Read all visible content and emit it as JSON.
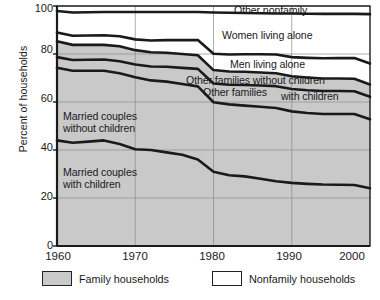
{
  "chart_data": {
    "type": "area",
    "title": "",
    "xlabel": "",
    "ylabel": "Percent of households",
    "xlim": [
      1960,
      2000
    ],
    "ylim": [
      0,
      100
    ],
    "xticks": [
      1960,
      1970,
      1980,
      1990,
      2000
    ],
    "yticks": [
      0,
      20,
      40,
      60,
      80,
      100
    ],
    "grid": true,
    "stacked": true,
    "legend_position": "bottom",
    "x": [
      1960,
      1962,
      1964,
      1966,
      1968,
      1970,
      1972,
      1974,
      1976,
      1978,
      1980,
      1982,
      1984,
      1986,
      1988,
      1990,
      1992,
      1994,
      1996,
      1998,
      2000
    ],
    "series": [
      {
        "name": "Married couples with children",
        "label": "Married couples\nwith children",
        "group": "Family households",
        "values": [
          44.0,
          43.0,
          43.5,
          44.0,
          42.5,
          40.3,
          40.0,
          39.0,
          38.0,
          36.0,
          30.9,
          29.5,
          29.0,
          28.0,
          27.0,
          26.3,
          25.9,
          25.6,
          25.5,
          25.4,
          24.1
        ],
        "cumulative": [
          44.0,
          43.0,
          43.5,
          44.0,
          42.5,
          40.3,
          40.0,
          39.0,
          38.0,
          36.0,
          30.9,
          29.5,
          29.0,
          28.0,
          27.0,
          26.3,
          25.9,
          25.6,
          25.5,
          25.4,
          24.1
        ]
      },
      {
        "name": "Married couples without children",
        "label": "Married couples\nwithout children",
        "group": "Family households",
        "values": [
          30.3,
          30.0,
          29.5,
          29.0,
          29.5,
          30.0,
          29.0,
          29.5,
          29.5,
          30.5,
          29.0,
          29.5,
          29.5,
          30.0,
          30.5,
          29.8,
          29.5,
          29.4,
          29.5,
          29.6,
          28.7
        ],
        "cumulative": [
          74.3,
          73.0,
          73.0,
          73.0,
          72.0,
          70.3,
          69.0,
          68.5,
          67.5,
          66.5,
          59.9,
          59.0,
          58.5,
          58.0,
          57.5,
          56.1,
          55.4,
          55.0,
          55.0,
          55.0,
          52.8
        ]
      },
      {
        "name": "Other families with children",
        "label": "Other families\nwith children",
        "group": "Family households",
        "values": [
          4.4,
          4.5,
          4.6,
          4.7,
          5.0,
          5.3,
          5.8,
          6.2,
          6.7,
          7.3,
          7.8,
          8.2,
          8.6,
          8.9,
          9.1,
          9.3,
          9.5,
          9.6,
          9.6,
          9.5,
          9.4
        ],
        "cumulative": [
          78.7,
          77.5,
          77.6,
          77.7,
          77.0,
          75.6,
          74.8,
          74.7,
          74.2,
          73.8,
          67.7,
          67.2,
          67.1,
          66.9,
          66.6,
          65.4,
          64.9,
          64.6,
          64.6,
          64.5,
          62.2
        ]
      },
      {
        "name": "Other families without children",
        "label": "Other families without children",
        "group": "Family households",
        "values": [
          6.6,
          6.3,
          6.2,
          6.1,
          6.2,
          6.0,
          5.9,
          5.8,
          5.8,
          5.7,
          5.6,
          5.5,
          5.5,
          5.4,
          5.4,
          5.3,
          5.3,
          5.2,
          5.2,
          5.2,
          5.1
        ],
        "cumulative": [
          85.3,
          83.8,
          83.8,
          83.8,
          83.2,
          81.6,
          80.7,
          80.5,
          80.0,
          79.5,
          73.3,
          72.7,
          72.6,
          72.3,
          72.0,
          70.7,
          70.2,
          69.8,
          69.8,
          69.7,
          67.3
        ]
      },
      {
        "name": "Men living alone",
        "label": "Men living alone",
        "group": "Nonfamily households",
        "values": [
          3.7,
          3.8,
          3.9,
          4.0,
          4.2,
          4.5,
          4.9,
          5.3,
          5.8,
          6.3,
          6.8,
          7.1,
          7.3,
          7.6,
          7.8,
          8.0,
          8.2,
          8.4,
          8.5,
          8.6,
          8.7
        ],
        "cumulative": [
          89.0,
          87.6,
          87.7,
          87.8,
          87.4,
          86.1,
          85.6,
          85.8,
          85.8,
          85.8,
          80.1,
          79.8,
          79.9,
          79.9,
          79.8,
          78.7,
          78.4,
          78.2,
          78.3,
          78.3,
          76.0
        ]
      },
      {
        "name": "Women living alone",
        "label": "Women living alone",
        "group": "Nonfamily households",
        "values": [
          8.9,
          9.7,
          9.7,
          9.7,
          10.1,
          11.4,
          11.9,
          11.7,
          11.7,
          11.7,
          17.2,
          17.4,
          17.2,
          17.1,
          17.1,
          18.2,
          18.4,
          18.5,
          18.4,
          18.4,
          20.6
        ],
        "cumulative": [
          97.9,
          97.3,
          97.4,
          97.5,
          97.5,
          97.5,
          97.5,
          97.5,
          97.5,
          97.5,
          97.3,
          97.2,
          97.1,
          97.0,
          96.9,
          96.9,
          96.8,
          96.7,
          96.7,
          96.7,
          96.6
        ]
      },
      {
        "name": "Other nonfamily",
        "label": "Other nonfamily",
        "group": "Nonfamily households",
        "values": [
          2.1,
          2.7,
          2.6,
          2.5,
          2.5,
          2.5,
          2.5,
          2.5,
          2.5,
          2.5,
          2.7,
          2.8,
          2.9,
          3.0,
          3.1,
          3.1,
          3.2,
          3.3,
          3.3,
          3.3,
          3.4
        ],
        "cumulative": [
          100,
          100,
          100,
          100,
          100,
          100,
          100,
          100,
          100,
          100,
          100,
          100,
          100,
          100,
          100,
          100,
          100,
          100,
          100,
          100,
          100
        ]
      }
    ],
    "annotations": [
      {
        "name": "other-nonfamily",
        "text": "Other nonfamily"
      },
      {
        "name": "women-living-alone",
        "text": "Women living alone"
      },
      {
        "name": "men-living-alone",
        "text": "Men living alone"
      },
      {
        "name": "other-families-without-children",
        "text": "Other families without children"
      },
      {
        "name": "other-families-with-children-a",
        "text": "Other families"
      },
      {
        "name": "other-families-with-children-b",
        "text": "with children"
      },
      {
        "name": "married-without-children-l1",
        "text": "Married couples"
      },
      {
        "name": "married-without-children-l2",
        "text": "without children"
      },
      {
        "name": "married-with-children-l1",
        "text": "Married couples"
      },
      {
        "name": "married-with-children-l2",
        "text": "with children"
      }
    ],
    "legend": [
      {
        "label": "Family households",
        "color": "#c9c9c9",
        "swatch": "filled"
      },
      {
        "label": "Nonfamily households",
        "color": "#ffffff",
        "swatch": "empty"
      }
    ],
    "colors": {
      "family_fill": "#c9c9c9",
      "nonfamily_fill": "#ffffff",
      "line": "#1a1a1a",
      "grid": "#8a8a8a",
      "axis": "#1a1a1a"
    }
  }
}
